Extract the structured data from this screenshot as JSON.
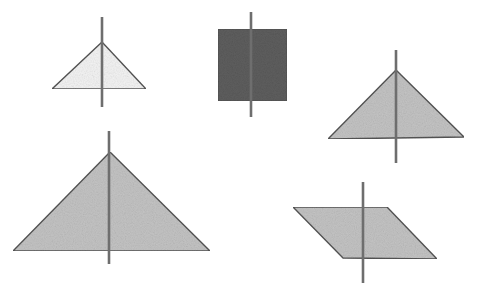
{
  "colors": {
    "background": "#ffffff",
    "outline": "#555555",
    "line": "#6e6e6e",
    "light_fill": "#f4f4f4",
    "medium_fill": "#c4c4c4",
    "dark_fill": "#5e5e5e"
  },
  "shapes": [
    {
      "id": "small-triangle",
      "type": "triangle",
      "fill": "light_fill",
      "points": [
        [
          102,
          42
        ],
        [
          52,
          89
        ],
        [
          146,
          89
        ]
      ],
      "line": [
        102,
        17,
        102,
        107
      ]
    },
    {
      "id": "dark-square",
      "type": "square",
      "fill": "dark_fill",
      "points": [
        [
          218,
          29
        ],
        [
          287,
          29
        ],
        [
          287,
          101
        ],
        [
          218,
          101
        ]
      ],
      "line": [
        251,
        12,
        251,
        117
      ]
    },
    {
      "id": "right-triangle",
      "type": "triangle",
      "fill": "medium_fill",
      "points": [
        [
          396,
          70
        ],
        [
          328,
          139
        ],
        [
          464,
          137
        ]
      ],
      "line": [
        396,
        50,
        396,
        163
      ]
    },
    {
      "id": "large-triangle",
      "type": "triangle",
      "fill": "medium_fill",
      "points": [
        [
          110,
          152
        ],
        [
          13,
          251
        ],
        [
          210,
          251
        ]
      ],
      "line": [
        109,
        131,
        109,
        264
      ]
    },
    {
      "id": "parallelogram",
      "type": "parallelogram",
      "fill": "medium_fill",
      "points": [
        [
          293,
          207
        ],
        [
          387,
          207
        ],
        [
          437,
          259
        ],
        [
          343,
          258
        ]
      ],
      "line": [
        363,
        182,
        363,
        283
      ]
    }
  ]
}
